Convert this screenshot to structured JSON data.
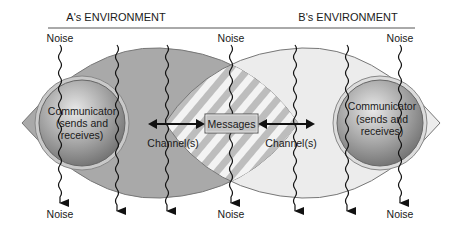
{
  "diagram": {
    "environments": [
      {
        "label": "A's ENVIRONMENT"
      },
      {
        "label": "B's ENVIRONMENT"
      }
    ],
    "noise_labels": {
      "top": [
        "Noise",
        "Noise",
        "Noise"
      ],
      "bottom": [
        "Noise",
        "Noise",
        "Noise"
      ]
    },
    "communicators": [
      {
        "line1": "Communicator",
        "line2": "(sends and",
        "line3": "receives)"
      },
      {
        "line1": "Communicator",
        "line2": "(sends and",
        "line3": "receives)"
      }
    ],
    "messages_label": "Messages",
    "channels": [
      "Channel(s)",
      "Channel(s)"
    ],
    "colors": {
      "env_a_fill": "#a9a9a9",
      "env_b_fill": "#ececec",
      "sphere_dark": "#7d7d7d",
      "sphere_light": "#e6e6e6",
      "messages_box": "#c4c4c4",
      "hatch_light": "#f2f2f2",
      "hatch_dark": "#b8b8b8"
    }
  }
}
